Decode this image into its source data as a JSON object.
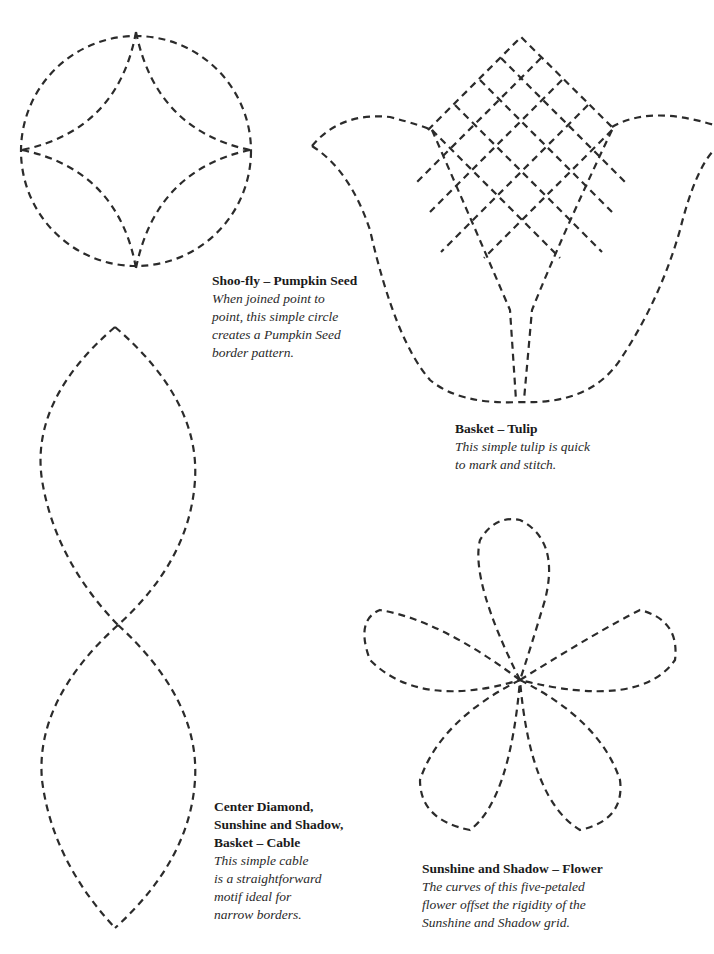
{
  "page": {
    "background": "#ffffff",
    "stitch_color": "#2b2b2b"
  },
  "patterns": [
    {
      "id": "pumpkin-seed",
      "title": "Shoo-fly – Pumpkin Seed",
      "description_lines": [
        "When joined point to",
        "point, this simple circle",
        "creates a Pumpkin Seed",
        "border pattern."
      ]
    },
    {
      "id": "tulip",
      "title": "Basket – Tulip",
      "description_lines": [
        "This simple tulip is quick",
        "to mark and stitch."
      ]
    },
    {
      "id": "cable",
      "title_lines": [
        "Center Diamond,",
        "Sunshine and Shadow,",
        "Basket – Cable"
      ],
      "description_lines": [
        "This simple cable",
        "is a straightforward",
        "motif ideal for",
        "narrow borders."
      ]
    },
    {
      "id": "flower",
      "title": "Sunshine and Shadow – Flower",
      "description_lines": [
        "The curves of this five-petaled",
        "flower offset the rigidity of the",
        "Sunshine and Shadow grid."
      ]
    }
  ]
}
